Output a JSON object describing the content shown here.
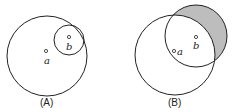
{
  "figures": [
    {
      "label": "(A)",
      "point_a": "a",
      "point_b": "b"
    },
    {
      "label": "(B)",
      "point_a": "a",
      "point_b": "b"
    }
  ],
  "colors": {
    "stroke": "#222222",
    "shade": "#bdbdbd"
  }
}
